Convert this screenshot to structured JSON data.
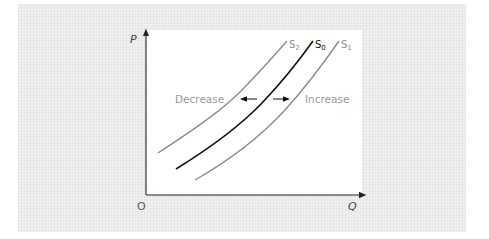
{
  "diagram": {
    "axes": {
      "y_label": "P",
      "x_label": "Q",
      "origin_label": "O"
    },
    "curves": [
      {
        "id": "S2",
        "label_main": "S",
        "label_sub": "2",
        "color": "#8c8c8c",
        "role": "decrease"
      },
      {
        "id": "S0",
        "label_main": "S",
        "label_sub": "0",
        "color": "#111111",
        "role": "original"
      },
      {
        "id": "S1",
        "label_main": "S",
        "label_sub": "1",
        "color": "#8c8c8c",
        "role": "increase"
      }
    ],
    "annotations": {
      "decrease": "Decrease",
      "increase": "Increase"
    },
    "colors": {
      "panel": "#ececec",
      "plot": "#ffffff",
      "axis": "#222222",
      "shift_curves": "#8c8c8c",
      "base_curve": "#111111",
      "annotation_text": "#9a9a9a"
    }
  }
}
